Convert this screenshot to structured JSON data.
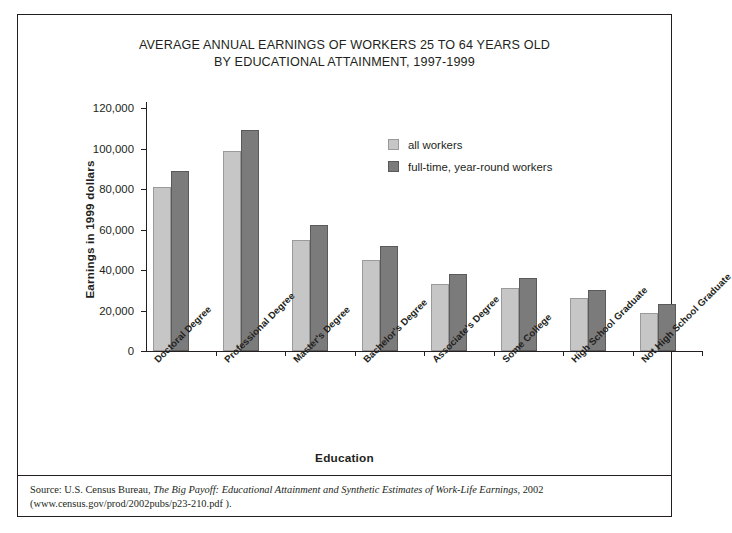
{
  "title": {
    "line1": "AVERAGE ANNUAL EARNINGS OF WORKERS 25 TO 64 YEARS OLD",
    "line2": "BY EDUCATIONAL ATTAINMENT, 1997-1999"
  },
  "axis": {
    "y_title": "Earnings in 1999 dollars",
    "x_title": "Education",
    "y_ticks": [
      "120,000",
      "100,000",
      "80,000",
      "60,000",
      "40,000",
      "20,000",
      "0"
    ]
  },
  "legend": {
    "items": [
      {
        "label": "all workers",
        "color": "#c6c6c6"
      },
      {
        "label": "full-time, year-round workers",
        "color": "#7b7b7b"
      }
    ]
  },
  "source": {
    "prefix": "Source: U.S. Census Bureau, ",
    "italic": "The Big Payoff: Educational Attainment and Synthetic Estimates of Work-Life Earnings",
    "suffix": ", 2002 (www.census.gov/prod/2002pubs/p23-210.pdf )."
  },
  "chart_data": {
    "type": "bar",
    "title": "AVERAGE ANNUAL EARNINGS OF WORKERS 25 TO 64 YEARS OLD BY EDUCATIONAL ATTAINMENT, 1997-1999",
    "xlabel": "Education",
    "ylabel": "Earnings in 1999 dollars",
    "ylim": [
      0,
      120000
    ],
    "ytick_step": 20000,
    "grid": false,
    "legend_position": "upper-right-inside",
    "categories": [
      "Doctoral Degree",
      "Professional Degree",
      "Master's Degree",
      "Bachelor's Degree",
      "Associate's Degree",
      "Some College",
      "High School Graduate",
      "Not High School Graduate"
    ],
    "series": [
      {
        "name": "all workers",
        "color": "#c6c6c6",
        "values": [
          81000,
          99000,
          55000,
          45000,
          33000,
          31000,
          26000,
          19000
        ]
      },
      {
        "name": "full-time, year-round workers",
        "color": "#7b7b7b",
        "values": [
          89000,
          109000,
          62000,
          52000,
          38000,
          36000,
          30000,
          23000
        ]
      }
    ]
  }
}
